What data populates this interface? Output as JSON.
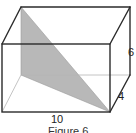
{
  "figure": {
    "caption": "Figure 6",
    "dimensions": {
      "length": "10",
      "height": "6",
      "depth": "4"
    },
    "colors": {
      "edge": "#2b2b2b",
      "hidden_edge": "#b5b5b5",
      "shaded_triangle": "#b8b8b8",
      "background": "#ffffff"
    },
    "shape": "rectangular-prism",
    "shaded_region": "triangle"
  }
}
